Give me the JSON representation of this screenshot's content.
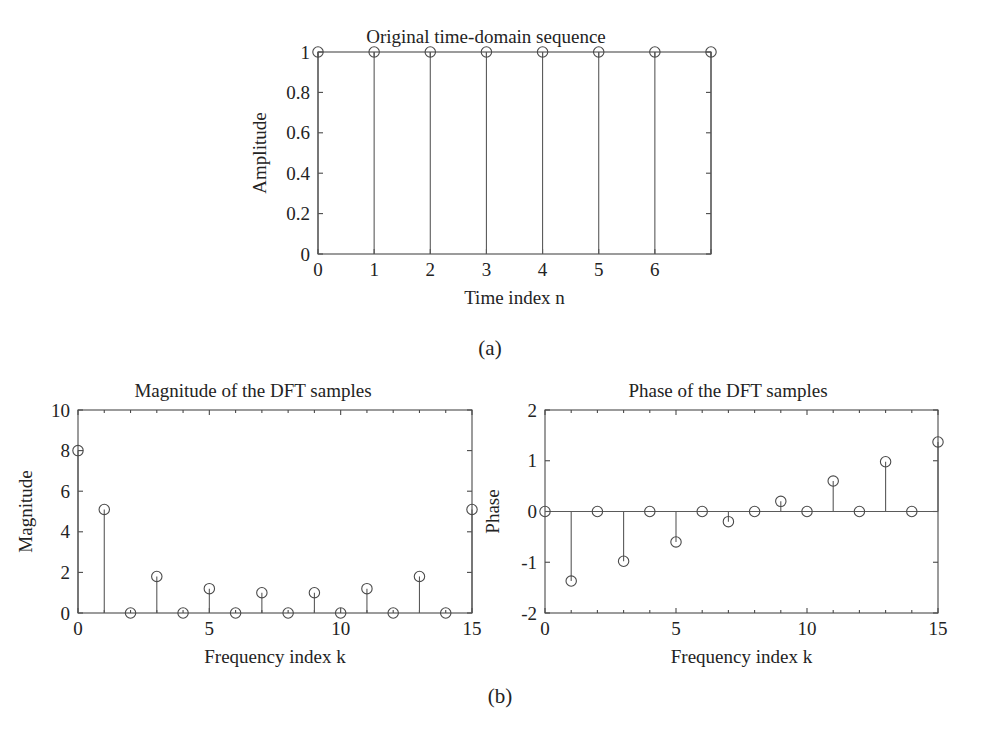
{
  "figure": {
    "background": "#ffffff",
    "line_color": "#4a4a4a",
    "subcaption_a": "(a)",
    "subcaption_b": "(b)"
  },
  "chart_data": [
    {
      "id": "time-domain",
      "type": "stem",
      "title": "Original time-domain sequence",
      "xlabel": "Time index n",
      "ylabel": "Amplitude",
      "x": [
        0,
        1,
        2,
        3,
        4,
        5,
        6,
        7
      ],
      "values": [
        1,
        1,
        1,
        1,
        1,
        1,
        1,
        1
      ],
      "xlim": [
        0,
        7
      ],
      "ylim": [
        0,
        1
      ],
      "xticks": [
        0,
        1,
        2,
        3,
        4,
        5,
        6,
        7
      ],
      "xticklabels": [
        "0",
        "1",
        "2",
        "3",
        "4",
        "5",
        "6",
        ""
      ],
      "yticks": [
        0,
        0.2,
        0.4,
        0.6,
        0.8,
        1
      ],
      "yticklabels": [
        "0",
        "0.2",
        "0.4",
        "0.6",
        "0.8",
        "1"
      ],
      "grid": false,
      "legend": "none",
      "marker": "circle"
    },
    {
      "id": "dft-magnitude",
      "type": "stem",
      "title": "Magnitude of the DFT samples",
      "xlabel": "Frequency index k",
      "ylabel": "Magnitude",
      "x": [
        0,
        1,
        2,
        3,
        4,
        5,
        6,
        7,
        8,
        9,
        10,
        11,
        12,
        13,
        14,
        15
      ],
      "values": [
        8,
        5.1,
        0,
        1.8,
        0,
        1.2,
        0,
        1.0,
        0,
        1.0,
        0,
        1.2,
        0,
        1.8,
        0,
        5.1
      ],
      "xlim": [
        0,
        15
      ],
      "ylim": [
        0,
        10
      ],
      "xticks": [
        0,
        5,
        10,
        15
      ],
      "xticklabels": [
        "0",
        "5",
        "10",
        "15"
      ],
      "xminorticks": [
        1,
        2,
        3,
        4,
        6,
        7,
        8,
        9,
        11,
        12,
        13,
        14
      ],
      "yticks": [
        0,
        2,
        4,
        6,
        8,
        10
      ],
      "yticklabels": [
        "0",
        "2",
        "4",
        "6",
        "8",
        "10"
      ],
      "grid": false,
      "legend": "none",
      "marker": "circle"
    },
    {
      "id": "dft-phase",
      "type": "stem",
      "title": "Phase of the DFT samples",
      "xlabel": "Frequency index k",
      "ylabel": "Phase",
      "x": [
        0,
        1,
        2,
        3,
        4,
        5,
        6,
        7,
        8,
        9,
        10,
        11,
        12,
        13,
        14,
        15
      ],
      "values": [
        0,
        -1.37,
        0,
        -0.98,
        0,
        -0.6,
        0,
        -0.2,
        0,
        0.2,
        0,
        0.6,
        0,
        0.98,
        0,
        1.37
      ],
      "xlim": [
        0,
        15
      ],
      "ylim": [
        -2,
        2
      ],
      "xticks": [
        0,
        5,
        10,
        15
      ],
      "xticklabels": [
        "0",
        "5",
        "10",
        "15"
      ],
      "xminorticks": [
        1,
        2,
        3,
        4,
        6,
        7,
        8,
        9,
        11,
        12,
        13,
        14
      ],
      "yticks": [
        -2,
        -1,
        0,
        1,
        2
      ],
      "yticklabels": [
        "-2",
        "-1",
        "0",
        "1",
        "2"
      ],
      "grid": false,
      "legend": "none",
      "marker": "circle"
    }
  ]
}
